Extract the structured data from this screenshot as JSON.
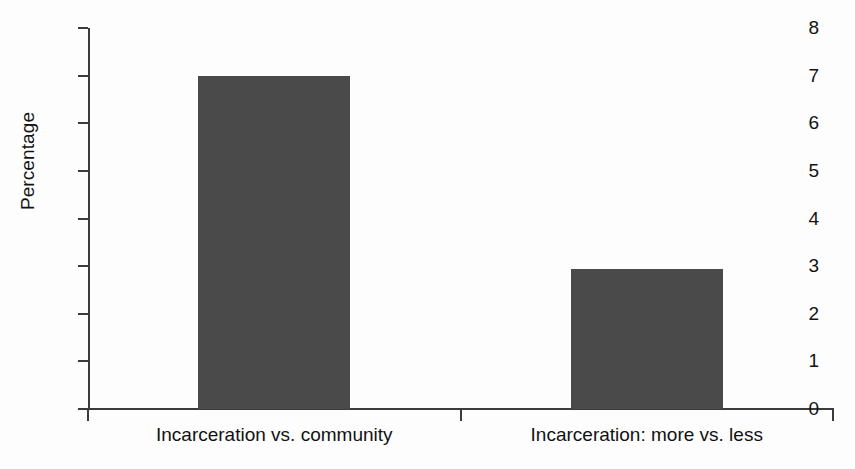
{
  "chart_data": {
    "type": "bar",
    "title": "",
    "xlabel": "",
    "ylabel": "Percentage",
    "categories": [
      "Incarceration vs. community",
      "Incarceration: more vs. less"
    ],
    "values": [
      7.0,
      2.95
    ],
    "ylim": [
      0,
      8
    ],
    "ytick_labels": [
      "0",
      "1",
      "2",
      "3",
      "4",
      "5",
      "6",
      "7",
      "8"
    ],
    "ytick_values": [
      0,
      1,
      2,
      3,
      4,
      5,
      6,
      7,
      8
    ],
    "grid": false,
    "legend": false,
    "bar_color": "#4a4a4a",
    "axis_color": "#3b3b3b",
    "background_color": "#fdfdfd"
  }
}
